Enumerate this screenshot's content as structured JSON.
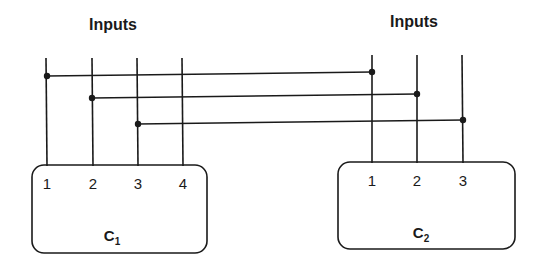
{
  "diagram": {
    "left_group": {
      "title": "Inputs",
      "component": {
        "name": "C",
        "subscript": "1",
        "pins": [
          "1",
          "2",
          "3",
          "4"
        ]
      }
    },
    "right_group": {
      "title": "Inputs",
      "component": {
        "name": "C",
        "subscript": "2",
        "pins": [
          "1",
          "2",
          "3"
        ]
      }
    },
    "connections": [
      {
        "from": "C1.pin1",
        "to": "C2.pin1"
      },
      {
        "from": "C1.pin2",
        "to": "C2.pin2"
      },
      {
        "from": "C1.pin3",
        "to": "C2.pin3"
      }
    ],
    "colors": {
      "ink": "#1a1a1a",
      "background": "#ffffff"
    }
  }
}
